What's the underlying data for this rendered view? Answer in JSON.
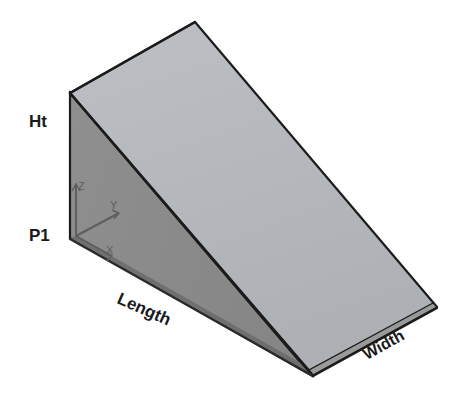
{
  "figure": {
    "background_color": "#ffffff",
    "width": 470,
    "height": 402
  },
  "solid": {
    "name": "wedge",
    "faces": {
      "top_slope_color": "#b6b9bd",
      "left_back_color": "#8d8d8d",
      "left_end_color": "#7c7c7c",
      "front_strip_color": "#9a9a9a",
      "bottom_edge_color": "#6f6f6f",
      "outline_color": "#1c1c1c"
    },
    "vertices": {
      "apex_top": [
        195,
        22
      ],
      "left_top": [
        70,
        92
      ],
      "left_bottom": [
        70,
        238
      ],
      "front_bottom": [
        313,
        375
      ],
      "right_bottom": [
        437,
        307
      ]
    }
  },
  "labels": {
    "height": "Ht",
    "origin_point": "P1",
    "length": "Length",
    "width": "Width"
  },
  "axis_triad": {
    "z_label": "Z",
    "y_label": "Y",
    "x_label": "X",
    "color": "#6a6a6a",
    "origin": [
      76,
      236
    ]
  }
}
